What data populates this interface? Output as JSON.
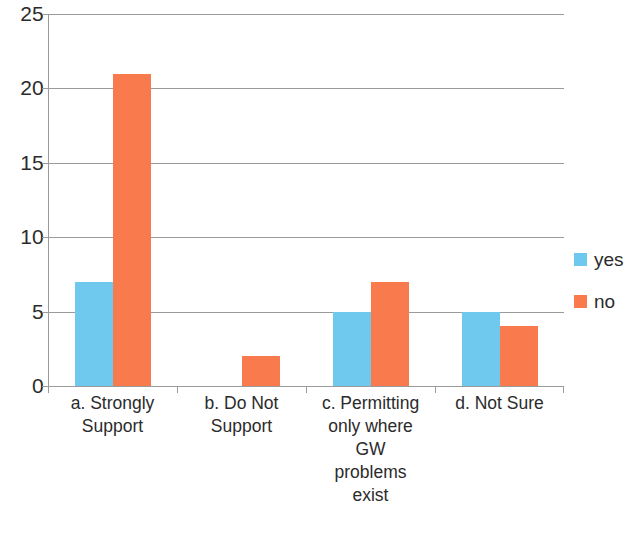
{
  "chart_data": {
    "type": "bar",
    "title": "",
    "xlabel": "",
    "ylabel": "",
    "ylim": [
      0,
      25
    ],
    "ytick_labels": [
      "25",
      "20",
      "15",
      "10",
      "5",
      "0"
    ],
    "ytick_values": [
      25,
      20,
      15,
      10,
      5,
      0
    ],
    "grid": true,
    "legend_position": "right",
    "categories": [
      "a. Strongly Support",
      "b. Do Not Support",
      "c. Permitting only where GW problems exist",
      "d. Not Sure"
    ],
    "category_label_lines": [
      [
        "a. Strongly",
        "Support"
      ],
      [
        "b. Do Not",
        "Support"
      ],
      [
        "c. Permitting",
        "only where",
        "GW",
        "problems",
        "exist"
      ],
      [
        "d. Not Sure"
      ]
    ],
    "series": [
      {
        "name": "yes",
        "color": "#6fc8ee",
        "values": [
          7,
          0,
          5,
          5
        ]
      },
      {
        "name": "no",
        "color": "#f97a4d",
        "values": [
          21,
          2,
          7,
          4
        ]
      }
    ]
  },
  "legend": {
    "items": [
      {
        "label": "yes",
        "swatch": "yes-color-swatch"
      },
      {
        "label": "no",
        "swatch": "no-color-swatch"
      }
    ]
  }
}
